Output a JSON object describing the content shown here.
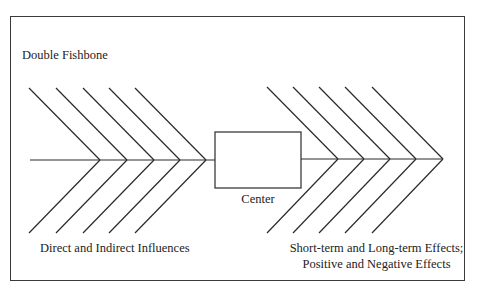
{
  "diagram": {
    "title": "Double Fishbone",
    "center_label": "Center",
    "left_label": "Direct and Indirect Influences",
    "right_label": {
      "line1": "Short-term and Long-term Effects;",
      "line2": "Positive and Negative Effects"
    },
    "colors": {
      "line": "#2a2a2a",
      "frame": "#3a3a3a",
      "background": "#ffffff"
    },
    "left_bones": {
      "count": 5,
      "tips_x": [
        100,
        127,
        154,
        180,
        206
      ],
      "top_y": 88,
      "spine_y": 160,
      "bottom_y": 233,
      "span_x": 71
    },
    "right_bones": {
      "count": 5,
      "tips_x": [
        338,
        364,
        390,
        416,
        443
      ],
      "top_y": 87,
      "spine_y": 159,
      "bottom_y": 233,
      "span_x": 71
    }
  }
}
